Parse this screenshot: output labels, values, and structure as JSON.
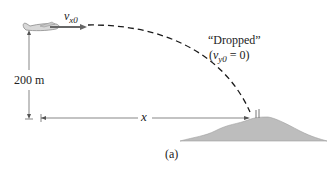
{
  "diagram": {
    "velocity_label": {
      "symbol": "v",
      "subscript": "x0"
    },
    "height_label": "200 m",
    "distance_label": "x",
    "dropped_label": "“Dropped”",
    "initial_condition": {
      "open": "(",
      "symbol": "v",
      "subscript": "y0",
      "rest": " = 0)"
    },
    "caption": "(a)",
    "colors": {
      "plane": "#9a9a9a",
      "arrow": "#666666",
      "trajectory": "#1a1a1a",
      "hill": "#b8b8b8",
      "dimension_lines": "#555555"
    }
  }
}
